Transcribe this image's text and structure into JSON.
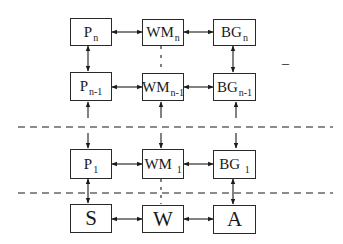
{
  "diagram": {
    "rows": [
      {
        "id": "row-n",
        "nodes": [
          {
            "id": "P_n",
            "base": "P",
            "sub": "n"
          },
          {
            "id": "WM_n",
            "base": "WM",
            "sub": "n"
          },
          {
            "id": "BG_n",
            "base": "BG",
            "sub": "n"
          }
        ]
      },
      {
        "id": "row-n-1",
        "nodes": [
          {
            "id": "P_n-1",
            "base": "P",
            "sub": "n-1"
          },
          {
            "id": "WM_n-1",
            "base": "WM",
            "sub": "n-1"
          },
          {
            "id": "BG_n-1",
            "base": "BG",
            "sub": "n-1"
          }
        ]
      },
      {
        "id": "row-1",
        "nodes": [
          {
            "id": "P_1",
            "base": "P",
            "sub": "1"
          },
          {
            "id": "WM_1",
            "base": "WM",
            "sub": "1"
          },
          {
            "id": "BG_1",
            "base": "BG",
            "sub": "1"
          }
        ]
      },
      {
        "id": "row-base",
        "nodes": [
          {
            "id": "S",
            "base": "S",
            "sub": ""
          },
          {
            "id": "W",
            "base": "W",
            "sub": ""
          },
          {
            "id": "A",
            "base": "A",
            "sub": ""
          }
        ]
      }
    ],
    "edges": [
      {
        "from": "P_n",
        "to": "WM_n",
        "type": "bidirectional"
      },
      {
        "from": "WM_n",
        "to": "BG_n",
        "type": "bidirectional"
      },
      {
        "from": "P_n",
        "to": "P_n-1",
        "type": "bidirectional"
      },
      {
        "from": "BG_n",
        "to": "BG_n-1",
        "type": "bidirectional"
      },
      {
        "from": "WM_n",
        "to": "WM_n-1",
        "type": "dashed"
      },
      {
        "from": "P_n-1",
        "to": "WM_n-1",
        "type": "bidirectional"
      },
      {
        "from": "WM_n-1",
        "to": "BG_n-1",
        "type": "bidirectional"
      },
      {
        "from": "lower",
        "to": "P_n-1",
        "type": "arrow-up"
      },
      {
        "from": "lower",
        "to": "WM_n-1",
        "type": "arrow-up"
      },
      {
        "from": "lower",
        "to": "BG_n-1",
        "type": "arrow-up"
      },
      {
        "from": "upper",
        "to": "P_1",
        "type": "arrow-down"
      },
      {
        "from": "upper",
        "to": "WM_1",
        "type": "arrow-down"
      },
      {
        "from": "upper",
        "to": "BG_1",
        "type": "arrow-down"
      },
      {
        "from": "P_1",
        "to": "WM_1",
        "type": "bidirectional"
      },
      {
        "from": "WM_1",
        "to": "BG_1",
        "type": "bidirectional"
      },
      {
        "from": "P_1",
        "to": "S",
        "type": "bidirectional"
      },
      {
        "from": "BG_1",
        "to": "A",
        "type": "bidirectional"
      },
      {
        "from": "WM_1",
        "to": "W",
        "type": "dashed"
      },
      {
        "from": "S",
        "to": "W",
        "type": "bidirectional"
      },
      {
        "from": "W",
        "to": "A",
        "type": "bidirectional"
      }
    ],
    "separators": [
      {
        "id": "separator-1",
        "style": "dashed"
      },
      {
        "id": "separator-2",
        "style": "dashed"
      }
    ],
    "stray_mark": "–"
  }
}
